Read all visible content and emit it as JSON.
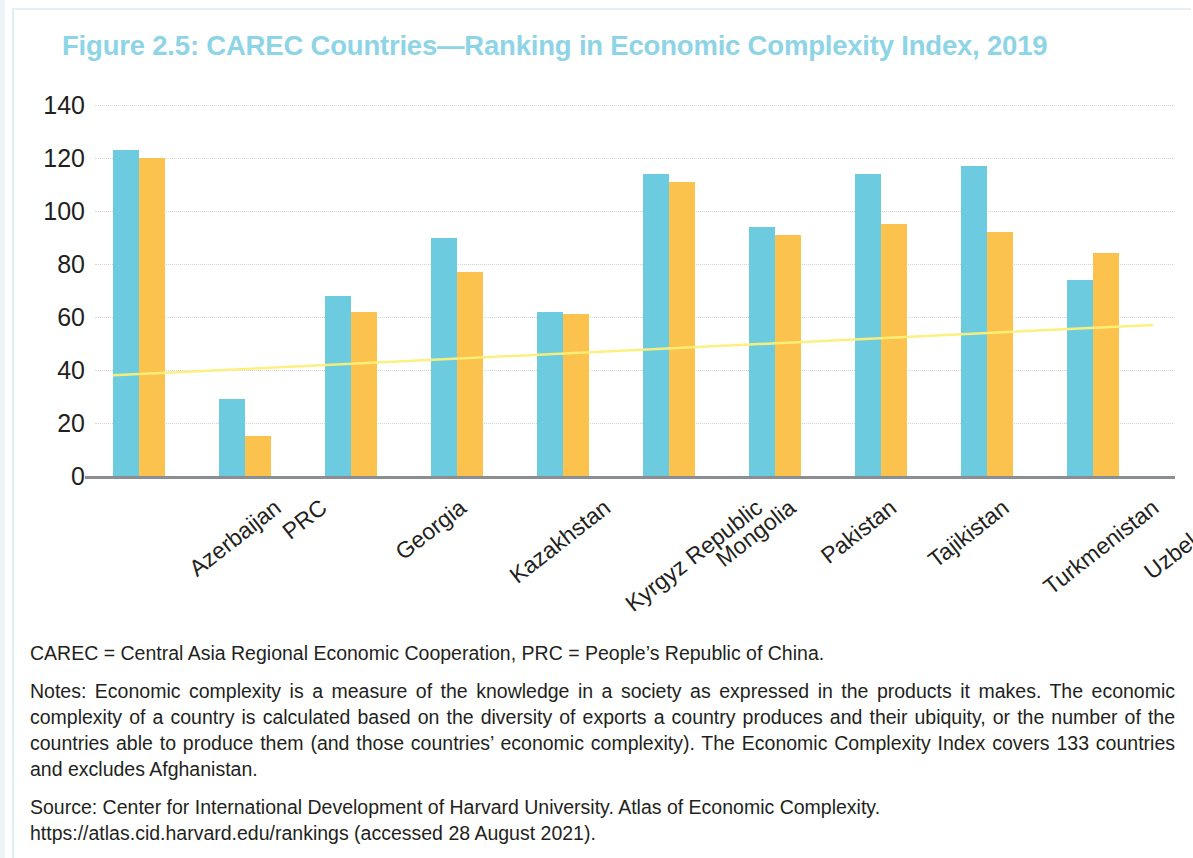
{
  "chart_data": {
    "type": "bar",
    "title": "Figure 2.5: CAREC Countries—Ranking in Economic Complexity Index, 2019",
    "xlabel": "",
    "ylabel": "",
    "ylim": [
      0,
      140
    ],
    "ytick_step": 20,
    "yticks": [
      140,
      120,
      100,
      80,
      60,
      40,
      20,
      0
    ],
    "grid": true,
    "legend": "none",
    "categories": [
      "Azerbaijan",
      "PRC",
      "Georgia",
      "Kazakhstan",
      "Kyrgyz Republic",
      "Mongolia",
      "Pakistan",
      "Tajikistan",
      "Turkmenistan",
      "Uzbekistan"
    ],
    "series": [
      {
        "name": "series-blue",
        "color": "#6dcbe0",
        "values": [
          123,
          29,
          68,
          90,
          62,
          114,
          94,
          114,
          117,
          74
        ]
      },
      {
        "name": "series-orange",
        "color": "#fbc34d",
        "values": [
          120,
          15,
          62,
          77,
          61,
          111,
          91,
          95,
          92,
          84
        ]
      }
    ],
    "trendline": {
      "name": "trend-overlay",
      "color": "#fdf07a",
      "start_value": 38,
      "end_value": 57
    }
  },
  "colors": {
    "title": "#8ed4e7",
    "blue_bar": "#6dcbe0",
    "orange_bar": "#fbc34d",
    "gridline": "#cfd6da",
    "axis": "#8b8f93",
    "text": "#231f20"
  },
  "footnotes": {
    "abbreviations": "CAREC = Central Asia Regional Economic Cooperation, PRC = People’s Republic of China.",
    "notes": "Notes: Economic complexity is a measure of the knowledge in a society as expressed in the products it makes. The economic complexity of a country is calculated based on the diversity of exports a country produces and their ubiquity, or the number of the countries able to produce them (and those countries’ economic complexity). The Economic Complexity Index covers 133 countries and excludes Afghanistan.",
    "source": "Source: Center for International Development of Harvard University. Atlas of Economic Complexity. https://atlas.cid.harvard.edu/rankings (accessed 28 August 2021)."
  }
}
